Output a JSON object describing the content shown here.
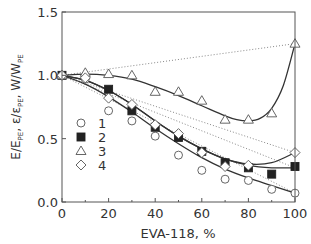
{
  "chart_data": {
    "type": "scatter",
    "title": "",
    "xlabel": "EVA-118, %",
    "ylabel": "E/E_PE, ε/ε_PE, W/W_PE",
    "ylabel_parts": {
      "a": "E/E",
      "a_sub": "PE",
      "b": ", ε/ε",
      "b_sub": "PE",
      "c": ", W/W",
      "c_sub": "PE"
    },
    "xlim": [
      0,
      100
    ],
    "ylim": [
      0,
      1.5
    ],
    "x_ticks": [
      0,
      20,
      40,
      60,
      80,
      100
    ],
    "x_tick_labels": [
      "0",
      "20",
      "40",
      "60",
      "80",
      "100"
    ],
    "y_ticks": [
      0.0,
      0.5,
      1.0,
      1.5
    ],
    "y_tick_labels": [
      "0.0",
      "0.5",
      "1.0",
      "1.5"
    ],
    "grid": false,
    "legend_position": "lower-left inside",
    "series": [
      {
        "name": "1",
        "marker": "circle-open",
        "x": [
          0,
          10,
          20,
          30,
          40,
          50,
          60,
          70,
          80,
          90,
          100
        ],
        "values": [
          1.0,
          0.97,
          0.72,
          0.64,
          0.52,
          0.37,
          0.25,
          0.18,
          0.17,
          0.1,
          0.07
        ],
        "fit": [
          [
            0,
            1.0
          ],
          [
            10,
            0.93
          ],
          [
            20,
            0.83
          ],
          [
            30,
            0.71
          ],
          [
            40,
            0.58
          ],
          [
            50,
            0.46
          ],
          [
            60,
            0.35
          ],
          [
            70,
            0.26
          ],
          [
            80,
            0.19
          ],
          [
            90,
            0.13
          ],
          [
            100,
            0.07
          ]
        ],
        "additive_line_end": 0.07
      },
      {
        "name": "2",
        "marker": "square-filled",
        "x": [
          0,
          20,
          30,
          40,
          50,
          60,
          70,
          80,
          90,
          100
        ],
        "values": [
          1.0,
          0.89,
          0.72,
          0.59,
          0.51,
          0.4,
          0.31,
          0.27,
          0.22,
          0.28
        ],
        "fit": [
          [
            0,
            1.0
          ],
          [
            10,
            0.96
          ],
          [
            20,
            0.88
          ],
          [
            30,
            0.77
          ],
          [
            40,
            0.64
          ],
          [
            50,
            0.52
          ],
          [
            60,
            0.42
          ],
          [
            70,
            0.34
          ],
          [
            80,
            0.29
          ],
          [
            90,
            0.27
          ],
          [
            100,
            0.27
          ]
        ],
        "additive_line_end": 0.27
      },
      {
        "name": "3",
        "marker": "triangle-open",
        "x": [
          0,
          10,
          20,
          30,
          40,
          50,
          60,
          70,
          80,
          90,
          100
        ],
        "values": [
          1.0,
          1.02,
          1.01,
          1.0,
          0.87,
          0.87,
          0.8,
          0.65,
          0.65,
          0.7,
          1.25
        ],
        "fit": [
          [
            0,
            1.0
          ],
          [
            10,
            1.01
          ],
          [
            20,
            1.0
          ],
          [
            30,
            0.97
          ],
          [
            40,
            0.91
          ],
          [
            50,
            0.84
          ],
          [
            60,
            0.76
          ],
          [
            70,
            0.68
          ],
          [
            75,
            0.65
          ],
          [
            80,
            0.64
          ],
          [
            85,
            0.66
          ],
          [
            90,
            0.74
          ],
          [
            95,
            0.92
          ],
          [
            100,
            1.25
          ]
        ],
        "additive_line_end": 1.25
      },
      {
        "name": "4",
        "marker": "diamond-open",
        "x": [
          0,
          10,
          20,
          30,
          40,
          50,
          60,
          70,
          80,
          100
        ],
        "values": [
          1.0,
          0.98,
          0.82,
          0.77,
          0.61,
          0.54,
          0.39,
          0.28,
          0.29,
          0.39
        ],
        "fit": [
          [
            0,
            1.0
          ],
          [
            10,
            0.96
          ],
          [
            20,
            0.88
          ],
          [
            30,
            0.77
          ],
          [
            40,
            0.64
          ],
          [
            50,
            0.52
          ],
          [
            60,
            0.42
          ],
          [
            70,
            0.34
          ],
          [
            80,
            0.3
          ],
          [
            90,
            0.31
          ],
          [
            100,
            0.39
          ]
        ],
        "additive_line_end": 0.39
      }
    ],
    "legend": [
      {
        "marker": "circle-open",
        "label": "1"
      },
      {
        "marker": "square-filled",
        "label": "2"
      },
      {
        "marker": "triangle-open",
        "label": "3"
      },
      {
        "marker": "diamond-open",
        "label": "4"
      }
    ]
  },
  "plot": {
    "x0": 62,
    "x1": 295,
    "ytop": 12,
    "ybottom": 202
  }
}
